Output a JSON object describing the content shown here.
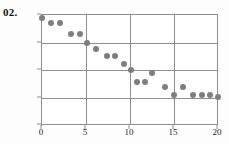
{
  "figure": {
    "label": "02."
  },
  "chart_data": {
    "type": "scatter",
    "title": "",
    "xlabel": "",
    "ylabel": "",
    "xlim": [
      0,
      20
    ],
    "ylim": [
      0,
      20
    ],
    "grid": true,
    "legend": false,
    "marker": {
      "shape": "circle",
      "color": "#7e7e7e",
      "size_px": 6
    },
    "axis_color": "#8e8e8e",
    "xticks": [
      0,
      5,
      10,
      15,
      20
    ],
    "yticks": [
      0,
      5,
      10,
      15,
      20
    ],
    "xtick_labels": [
      "0",
      "5",
      "10",
      "15",
      "20"
    ],
    "ytick_labels": [
      "0",
      "5",
      "10",
      "15",
      "20"
    ],
    "points": [
      {
        "x": 0.0,
        "y": 19.5
      },
      {
        "x": 1.0,
        "y": 18.6
      },
      {
        "x": 2.1,
        "y": 18.6
      },
      {
        "x": 3.3,
        "y": 16.5
      },
      {
        "x": 4.3,
        "y": 16.6
      },
      {
        "x": 5.1,
        "y": 15.0
      },
      {
        "x": 6.1,
        "y": 13.9
      },
      {
        "x": 7.4,
        "y": 12.5
      },
      {
        "x": 8.3,
        "y": 12.5
      },
      {
        "x": 9.3,
        "y": 11.1
      },
      {
        "x": 10.1,
        "y": 10.0
      },
      {
        "x": 10.8,
        "y": 7.9
      },
      {
        "x": 11.7,
        "y": 7.9
      },
      {
        "x": 12.5,
        "y": 9.4
      },
      {
        "x": 14.0,
        "y": 6.9
      },
      {
        "x": 15.0,
        "y": 5.5
      },
      {
        "x": 16.0,
        "y": 7.0
      },
      {
        "x": 17.2,
        "y": 5.4
      },
      {
        "x": 18.2,
        "y": 5.5
      },
      {
        "x": 19.1,
        "y": 5.5
      },
      {
        "x": 20.0,
        "y": 5.1
      }
    ]
  }
}
